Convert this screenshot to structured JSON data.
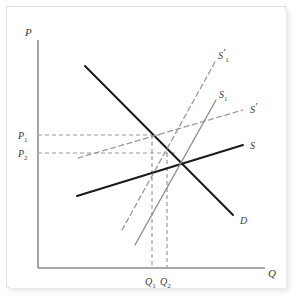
{
  "figure": {
    "kind": "economics-supply-demand-diagram",
    "background_color": "#ffffff",
    "frame_color": "#e2e2e2"
  },
  "axes": {
    "y_axis_label": "P",
    "x_axis_label": "Q",
    "axis_color": "#8c8c8c",
    "origin_px": [
      38,
      268
    ],
    "x_axis_end_px": [
      265,
      268
    ],
    "y_axis_end_px": [
      38,
      40
    ]
  },
  "price_ticks": [
    {
      "name": "P1",
      "label_main": "P",
      "label_sub": "1",
      "y_px": 135
    },
    {
      "name": "P2",
      "label_main": "P",
      "label_sub": "2",
      "y_px": 153
    }
  ],
  "quantity_ticks": [
    {
      "name": "Q1",
      "label_main": "Q",
      "label_sub": "1",
      "x_px": 152
    },
    {
      "name": "Q2",
      "label_main": "Q",
      "label_sub": "2",
      "x_px": 167
    }
  ],
  "curves": [
    {
      "id": "demand",
      "label_main": "D",
      "label_sub": "",
      "prime": false,
      "style": "solid",
      "color": "#1a1a1a",
      "width": 2.0,
      "x1": 85,
      "y1": 66,
      "x2": 233,
      "y2": 215,
      "label_x": 240,
      "label_y": 224
    },
    {
      "id": "supply",
      "label_main": "S",
      "label_sub": "",
      "prime": false,
      "style": "solid",
      "color": "#1a1a1a",
      "width": 2.0,
      "x1": 77,
      "y1": 196,
      "x2": 243,
      "y2": 145,
      "label_x": 250,
      "label_y": 149
    },
    {
      "id": "supply-prime",
      "label_main": "S",
      "label_sub": "",
      "prime": true,
      "style": "dashed",
      "color": "#9a9a9a",
      "width": 1.3,
      "x1": 78,
      "y1": 158,
      "x2": 243,
      "y2": 110,
      "label_x": 250,
      "label_y": 113
    },
    {
      "id": "supply-1",
      "label_main": "S",
      "label_sub": "1",
      "prime": false,
      "style": "solid",
      "color": "#8f8f8f",
      "width": 1.4,
      "x1": 135,
      "y1": 245,
      "x2": 216,
      "y2": 100,
      "label_x": 219,
      "label_y": 98
    },
    {
      "id": "supply-prime-1",
      "label_main": "S",
      "label_sub": "1",
      "prime": true,
      "style": "dashed",
      "color": "#9a9a9a",
      "width": 1.3,
      "x1": 122,
      "y1": 230,
      "x2": 215,
      "y2": 62,
      "label_x": 218,
      "label_y": 59
    }
  ],
  "guide_lines": {
    "color": "#9a9a9a",
    "dash": "4,3",
    "horizontal": [
      {
        "name": "p1-guide",
        "x1": 38,
        "y1": 135,
        "x2": 160,
        "y2": 135
      },
      {
        "name": "p2-guide",
        "x1": 38,
        "y1": 153,
        "x2": 175,
        "y2": 153
      }
    ],
    "vertical": [
      {
        "name": "q1-guide",
        "x1": 152,
        "y1": 135,
        "x2": 152,
        "y2": 268
      },
      {
        "name": "q2-guide",
        "x1": 167,
        "y1": 153,
        "x2": 167,
        "y2": 268
      }
    ]
  },
  "chart_data": {
    "type": "line",
    "title": "",
    "xlabel": "Q",
    "ylabel": "P",
    "grid": false,
    "legend": "inline-curve-labels",
    "series": [
      {
        "name": "D",
        "note": "demand curve, downward sloping, solid black"
      },
      {
        "name": "S",
        "note": "original supply, upward sloping, solid black"
      },
      {
        "name": "S'",
        "note": "shifted supply, flatter, dashed gray"
      },
      {
        "name": "S1",
        "note": "steep supply, solid gray"
      },
      {
        "name": "S'1",
        "note": "steep shifted supply, dashed gray"
      }
    ],
    "marked_prices": [
      "P1",
      "P2"
    ],
    "marked_quantities": [
      "Q1",
      "Q2"
    ]
  }
}
